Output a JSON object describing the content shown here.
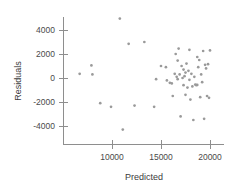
{
  "chart_data": {
    "type": "scatter",
    "title": "",
    "xlabel": "Predicted",
    "ylabel": "Residuals",
    "xlim": [
      6500,
      21000
    ],
    "ylim": [
      -4700,
      5200
    ],
    "grid": false,
    "legend": null,
    "xticks": [
      10000,
      15000,
      20000
    ],
    "xtick_labels": [
      "10000",
      "15000",
      "20000"
    ],
    "yticks": [
      4000,
      2000,
      0,
      -2000,
      -4000
    ],
    "ytick_labels": [
      "4000",
      "2000",
      "0",
      "-2000",
      "-4000"
    ],
    "marker": "circle",
    "marker_color": "#9a9a9a",
    "points": [
      [
        6700,
        350
      ],
      [
        7900,
        1050
      ],
      [
        8000,
        300
      ],
      [
        8800,
        -2100
      ],
      [
        9900,
        -2400
      ],
      [
        10800,
        4950
      ],
      [
        11100,
        -4300
      ],
      [
        11700,
        2850
      ],
      [
        12300,
        -2300
      ],
      [
        13300,
        3000
      ],
      [
        14300,
        -2400
      ],
      [
        14500,
        -100
      ],
      [
        15000,
        1000
      ],
      [
        15500,
        900
      ],
      [
        15600,
        -200
      ],
      [
        15900,
        -400
      ],
      [
        16100,
        -450
      ],
      [
        16200,
        -1500
      ],
      [
        16400,
        350
      ],
      [
        16500,
        2000
      ],
      [
        16600,
        100
      ],
      [
        16700,
        -100
      ],
      [
        16700,
        1450
      ],
      [
        16800,
        2450
      ],
      [
        16900,
        300
      ],
      [
        17000,
        -3200
      ],
      [
        17100,
        1000
      ],
      [
        17200,
        0
      ],
      [
        17300,
        700
      ],
      [
        17300,
        -600
      ],
      [
        17400,
        150
      ],
      [
        17500,
        -1400
      ],
      [
        17500,
        450
      ],
      [
        17600,
        1200
      ],
      [
        17700,
        -800
      ],
      [
        17800,
        600
      ],
      [
        17900,
        -150
      ],
      [
        17900,
        2350
      ],
      [
        18000,
        -1800
      ],
      [
        18100,
        350
      ],
      [
        18200,
        -700
      ],
      [
        18300,
        -3500
      ],
      [
        18400,
        100
      ],
      [
        18500,
        -550
      ],
      [
        18600,
        -600
      ],
      [
        18700,
        -580
      ],
      [
        18700,
        1750
      ],
      [
        18800,
        900
      ],
      [
        18900,
        1500
      ],
      [
        19000,
        -1600
      ],
      [
        19100,
        300
      ],
      [
        19200,
        -350
      ],
      [
        19300,
        2250
      ],
      [
        19400,
        -3400
      ],
      [
        19500,
        1100
      ],
      [
        19600,
        800
      ],
      [
        19700,
        -1500
      ],
      [
        19800,
        1150
      ],
      [
        19900,
        -1650
      ],
      [
        20000,
        2300
      ]
    ]
  }
}
